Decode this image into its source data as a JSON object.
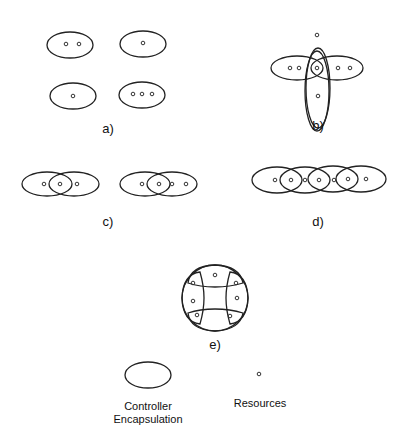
{
  "figure": {
    "panels": [
      {
        "id": "a",
        "label": "a)",
        "description": "Four separate controller encapsulations with 2, 1, 1 and 3 resources"
      },
      {
        "id": "b",
        "label": "b)",
        "description": "Four encapsulations in a cross arrangement sharing one central resource"
      },
      {
        "id": "c",
        "label": "c)",
        "description": "Two pairs of overlapping encapsulations each sharing one resource"
      },
      {
        "id": "d",
        "label": "d)",
        "description": "Chain of four overlapping encapsulations sharing resources pairwise"
      },
      {
        "id": "e",
        "label": "e)",
        "description": "Ring of four encapsulations sharing corner resources"
      }
    ],
    "legend": {
      "encapsulation_label_line1": "Controller",
      "encapsulation_label_line2": "Encapsulation",
      "resource_label": "Resources"
    }
  }
}
